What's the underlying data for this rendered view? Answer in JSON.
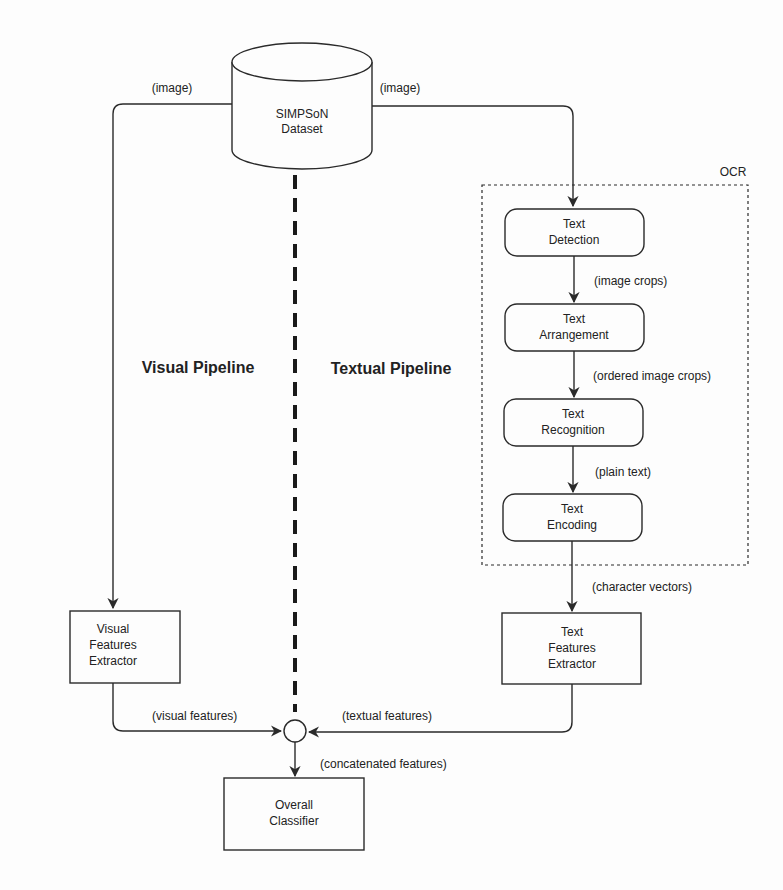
{
  "diagram": {
    "dataset": {
      "line1": "SIMPSoN",
      "line2": "Dataset"
    },
    "ocr_group": {
      "label": "OCR"
    },
    "ocr_steps": [
      {
        "line1": "Text",
        "line2": "Detection"
      },
      {
        "line1": "Text",
        "line2": "Arrangement"
      },
      {
        "line1": "Text",
        "line2": "Recognition"
      },
      {
        "line1": "Text",
        "line2": "Encoding"
      }
    ],
    "visual_extractor": {
      "line1": "Visual",
      "line2": "Features",
      "line3": "Extractor"
    },
    "text_extractor": {
      "line1": "Text",
      "line2": "Features",
      "line3": "Extractor"
    },
    "classifier": {
      "line1": "Overall",
      "line2": "Classifier"
    },
    "pipelines": {
      "visual": "Visual Pipeline",
      "textual": "Textual Pipeline"
    },
    "edges": {
      "image_left": "(image)",
      "image_right": "(image)",
      "image_crops": "(image crops)",
      "ordered_image_crops": "(ordered image crops)",
      "plain_text": "(plain text)",
      "character_vectors": "(character vectors)",
      "visual_features": "(visual features)",
      "textual_features": "(textual features)",
      "concatenated_features": "(concatenated features)"
    }
  }
}
